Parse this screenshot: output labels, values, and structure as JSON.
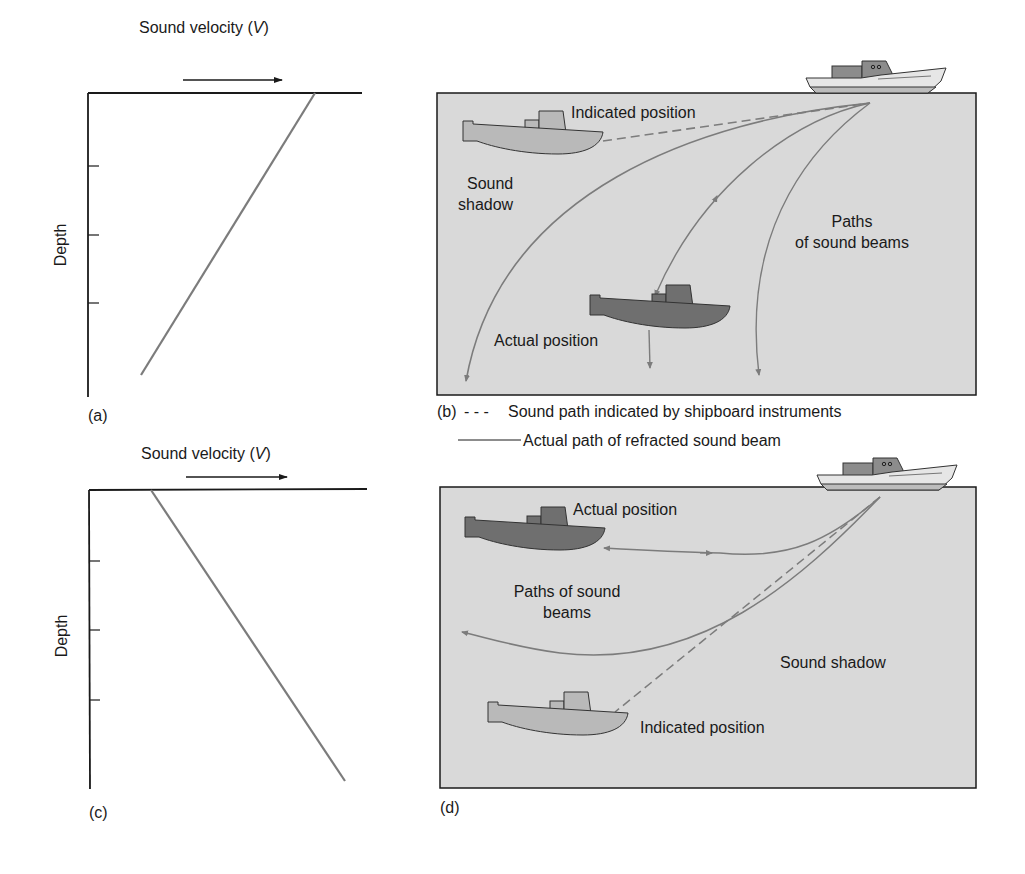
{
  "colors": {
    "water": "#d9d9d9",
    "beam": "#7c7c7c",
    "actual_sub": "#6f6f6f",
    "indicated_sub": "#b9b9b9",
    "ship_hull": "#e6e6e6",
    "ship_cabin": "#8c8c8c",
    "ship_deck": "#bcbcbc",
    "axis": "#1a1a1a"
  },
  "panel_a": {
    "label": "(a)",
    "axis_title": "Sound velocity (",
    "axis_title_var": "V",
    "axis_title_end": ")",
    "y_label": "Depth",
    "profile": "velocity decreases with depth"
  },
  "panel_b": {
    "label": "(b)",
    "indicated_position": "Indicated position",
    "actual_position": "Actual position",
    "sound_shadow_line1": "Sound",
    "sound_shadow_line2": "shadow",
    "paths_line1": "Paths",
    "paths_line2": "of sound beams"
  },
  "legend": {
    "dashed_symbol": "- - -",
    "dashed_text": "Sound path indicated by shipboard instruments",
    "solid_text": "Actual path of refracted sound beam"
  },
  "panel_c": {
    "label": "(c)",
    "axis_title": "Sound velocity (",
    "axis_title_var": "V",
    "axis_title_end": ")",
    "y_label": "Depth",
    "profile": "velocity increases with depth"
  },
  "panel_d": {
    "label": "(d)",
    "actual_position": "Actual position",
    "paths_line1": "Paths of sound",
    "paths_line2": "beams",
    "sound_shadow": "Sound shadow",
    "indicated_position": "Indicated position"
  }
}
